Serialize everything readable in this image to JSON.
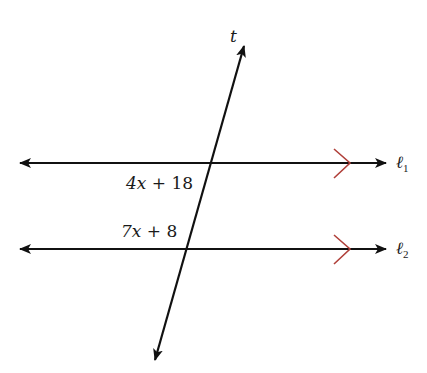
{
  "diagram": {
    "type": "parallel-lines-transversal",
    "colors": {
      "line": "#111111",
      "parallel_mark": "#b0403a",
      "background": "#ffffff"
    },
    "transversal": {
      "label": "t"
    },
    "lines": [
      {
        "label": "ℓ",
        "subscript": "1",
        "angle_label_var": "4x",
        "angle_label_rest": " + 18"
      },
      {
        "label": "ℓ",
        "subscript": "2",
        "angle_label_var": "7x",
        "angle_label_rest": " + 8"
      }
    ]
  }
}
